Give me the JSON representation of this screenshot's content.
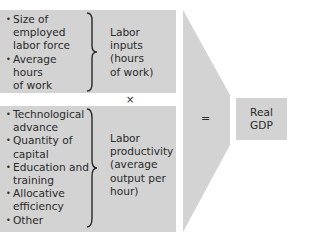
{
  "diagram": {
    "labor_inputs": {
      "factors": [
        "Size of employed labor force",
        "Average hours of work"
      ],
      "factor_lines": [
        [
          "Size of",
          "employed",
          "labor force"
        ],
        [
          "Average",
          "hours",
          "of work"
        ]
      ],
      "result_lines": [
        "Labor",
        "inputs",
        "(hours",
        "of work)"
      ]
    },
    "operator_times": "×",
    "labor_productivity": {
      "factor_lines": [
        [
          "Technological",
          "advance"
        ],
        [
          "Quantity of",
          "capital"
        ],
        [
          "Education and",
          "training"
        ],
        [
          "Allocative",
          "efficiency"
        ],
        [
          "Other"
        ]
      ],
      "result_lines": [
        "Labor",
        "productivity",
        "(average",
        "output per",
        "hour)"
      ]
    },
    "operator_equals": "=",
    "output_lines": [
      "Real",
      "GDP"
    ],
    "colors": {
      "box_fill": "#d3d3d3",
      "text": "#2a2a2a",
      "background": "#ffffff"
    }
  }
}
